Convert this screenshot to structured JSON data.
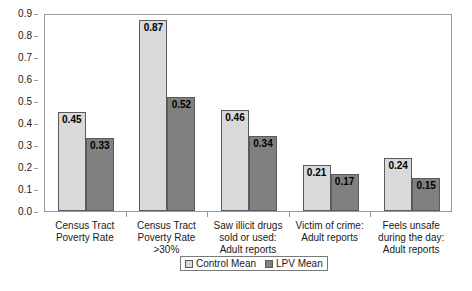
{
  "chart_data": {
    "type": "bar",
    "title": "",
    "subtitle": "",
    "xlabel": "",
    "ylabel": "",
    "ylim": [
      0.0,
      0.9
    ],
    "ytick_labels": [
      "0.0",
      "0.1",
      "0.2",
      "0.3",
      "0.4",
      "0.5",
      "0.6",
      "0.7",
      "0.8",
      "0.9"
    ],
    "ytick_values": [
      0.0,
      0.1,
      0.2,
      0.3,
      0.4,
      0.5,
      0.6,
      0.7,
      0.8,
      0.9
    ],
    "grid": false,
    "legend_position": "bottom",
    "categories": [
      "Census Tract\nPoverty Rate",
      "Census Tract\nPoverty Rate >30%",
      "Saw illicit drugs\nsold or used:\nAdult reports",
      "Victim of crime:\nAdult reports",
      "Feels unsafe\nduring the day:\nAdult reports"
    ],
    "series": [
      {
        "name": "Control Mean",
        "color": "#d9d9d9",
        "values": [
          0.45,
          0.87,
          0.46,
          0.21,
          0.24
        ],
        "labels": [
          "0.45",
          "0.87",
          "0.46",
          "0.21",
          "0.24"
        ]
      },
      {
        "name": "LPV Mean",
        "color": "#808080",
        "values": [
          0.33,
          0.52,
          0.34,
          0.17,
          0.15
        ],
        "labels": [
          "0.33",
          "0.52",
          "0.34",
          "0.17",
          "0.15"
        ]
      }
    ]
  },
  "legend": {
    "entries": [
      {
        "label": "Control Mean",
        "swatch": "series-control"
      },
      {
        "label": "LPV Mean",
        "swatch": "series-lpv"
      }
    ]
  }
}
